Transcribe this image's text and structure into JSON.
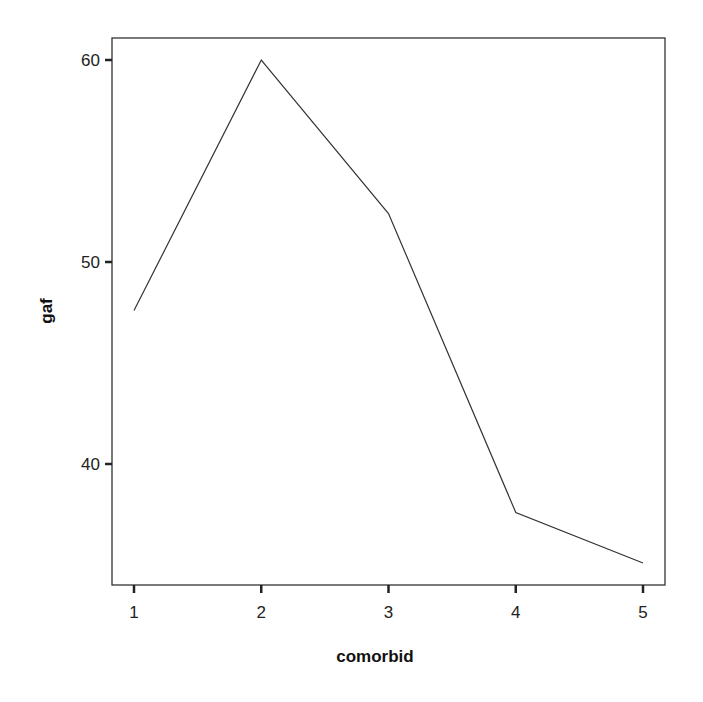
{
  "chart_data": {
    "type": "line",
    "title": "",
    "xlabel": "comorbid",
    "ylabel": "gaf",
    "x": [
      1,
      2,
      3,
      4,
      5
    ],
    "categories": [
      "1",
      "2",
      "3",
      "4",
      "5"
    ],
    "values": [
      47.6,
      60.0,
      52.4,
      37.6,
      35.1
    ],
    "series": [
      {
        "name": "gaf",
        "values": [
          47.6,
          60.0,
          52.4,
          37.6,
          35.1
        ]
      }
    ],
    "xticks": [
      "1",
      "2",
      "3",
      "4",
      "5"
    ],
    "yticks": [
      "40",
      "50",
      "60"
    ],
    "ylim": [
      34.0,
      61.1
    ],
    "xlim": [
      0.82,
      5.17
    ],
    "grid": false,
    "legend": null
  },
  "style": {
    "line_color": "#333333",
    "axis_color": "#333333"
  }
}
